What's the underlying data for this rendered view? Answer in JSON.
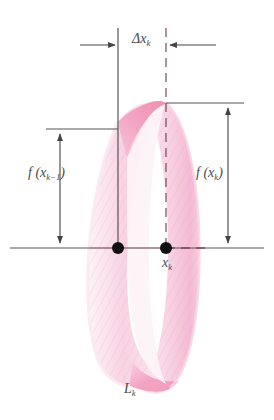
{
  "figure": {
    "type": "geometry-diagram",
    "background_color": "#ffffff"
  },
  "labels": {
    "delta_x": {
      "base": "Δx",
      "sub": "k"
    },
    "f_x_k_minus_1": {
      "prefix": "f (x",
      "sub": "k−1",
      "suffix": ")"
    },
    "f_x_k": {
      "prefix": "f (x",
      "sub": "k",
      "suffix": ")"
    },
    "x_k": {
      "base": "x",
      "sub": "k"
    },
    "L_k": {
      "base": "L",
      "sub": "k"
    }
  },
  "colors": {
    "band_light": "#f9dbe6",
    "band_mid": "#f6c3d6",
    "band_dark": "#f29ab9",
    "band_pale": "#fdf2f6",
    "hatch": "#f2a9c4",
    "axis_line": "#555555",
    "guide_line": "#555555",
    "dashed_line": "#7a4a58",
    "dot": "#111111",
    "text": "#4a4a4a"
  },
  "geometry": {
    "axis_y": 248,
    "axis_x_start": 10,
    "axis_x_end": 264,
    "left_station_x": 118,
    "right_station_x": 166,
    "left_curve_top_y": 122,
    "right_curve_top_y": 103,
    "dx_arrow_y": 45,
    "left_tick_y": 129,
    "right_tick_y": 103,
    "left_measure_x": 60,
    "right_measure_x": 228
  },
  "elements": {
    "band_name": "frustum-band",
    "axis_name": "horizontal-axis",
    "left_dot_name": "point-x-k-minus-1",
    "right_dot_name": "point-x-k"
  }
}
